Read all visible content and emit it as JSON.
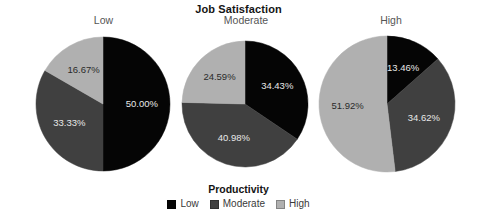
{
  "chart_data": {
    "type": "pie",
    "title": "Job Satisfaction",
    "xlabel": "",
    "ylabel": "",
    "grid": false,
    "legend_position": "bottom",
    "legend_title": "Productivity",
    "categories": [
      "Low",
      "Moderate",
      "High"
    ],
    "colors": {
      "low": "#050505",
      "moderate": "#404040",
      "high": "#b0b0b0",
      "background": "#ffffff",
      "title": "#141414",
      "panel_label": "#555555",
      "label_light": "#e8e8e8",
      "label_dark": "#2a2a2a"
    },
    "panels": [
      {
        "label": "Low",
        "values": [
          50.0,
          33.33,
          16.67
        ],
        "slices": [
          {
            "name": "Low",
            "value": 50.0,
            "display": "50.00%",
            "color_key": "low"
          },
          {
            "name": "Moderate",
            "value": 33.33,
            "display": "33.33%",
            "color_key": "moderate"
          },
          {
            "name": "High",
            "value": 16.67,
            "display": "16.67%",
            "color_key": "high"
          }
        ]
      },
      {
        "label": "Moderate",
        "values": [
          34.43,
          40.98,
          24.59
        ],
        "slices": [
          {
            "name": "Low",
            "value": 34.43,
            "display": "34.43%",
            "color_key": "low"
          },
          {
            "name": "Moderate",
            "value": 40.98,
            "display": "40.98%",
            "color_key": "moderate"
          },
          {
            "name": "High",
            "value": 24.59,
            "display": "24.59%",
            "color_key": "high"
          }
        ]
      },
      {
        "label": "High",
        "values": [
          13.46,
          34.62,
          51.92
        ],
        "slices": [
          {
            "name": "Low",
            "value": 13.46,
            "display": "13.46%",
            "color_key": "low"
          },
          {
            "name": "Moderate",
            "value": 34.62,
            "display": "34.62%",
            "color_key": "moderate"
          },
          {
            "name": "High",
            "value": 51.92,
            "display": "51.92%",
            "color_key": "high"
          }
        ]
      }
    ],
    "legend_entries": [
      {
        "label": "Low",
        "color_key": "low"
      },
      {
        "label": "Moderate",
        "color_key": "moderate"
      },
      {
        "label": "High",
        "color_key": "high"
      }
    ]
  },
  "layout": {
    "panel_geometry": [
      {
        "left": 26,
        "width": 155,
        "cx": 77,
        "cy": 90,
        "r": 67
      },
      {
        "left": 181,
        "width": 130,
        "cx": 64,
        "cy": 90,
        "r": 63
      },
      {
        "left": 311,
        "width": 160,
        "cx": 76,
        "cy": 90,
        "r": 68
      }
    ],
    "legend_top": 183
  }
}
